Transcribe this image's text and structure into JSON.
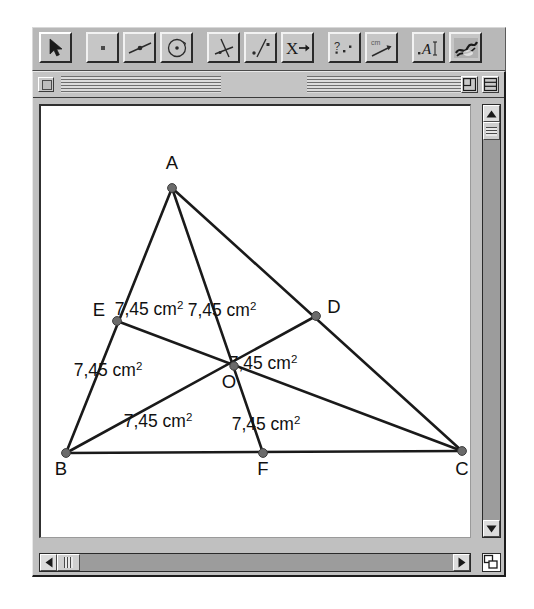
{
  "app": {
    "name": "Cabri Geometry",
    "background_color": "#ffffff",
    "window_chrome_color": "#c0c0c0"
  },
  "toolbar": {
    "groups": [
      {
        "name": "selection",
        "tools": [
          {
            "id": "pointer",
            "icon": "arrow-pointer-icon",
            "label": "Pointer",
            "selected": true
          }
        ]
      },
      {
        "name": "construction",
        "tools": [
          {
            "id": "point",
            "icon": "point-icon",
            "label": "Point",
            "selected": false
          },
          {
            "id": "line",
            "icon": "line-through-point-icon",
            "label": "Line",
            "selected": false
          },
          {
            "id": "circle",
            "icon": "circle-icon",
            "label": "Circle",
            "selected": false
          }
        ]
      },
      {
        "name": "transform",
        "tools": [
          {
            "id": "perpendicular",
            "icon": "perpendicular-line-icon",
            "label": "Perpendicular Line",
            "selected": false
          },
          {
            "id": "reflect",
            "icon": "reflect-point-line-icon",
            "label": "Reflection",
            "selected": false
          },
          {
            "id": "macro",
            "icon": "x-arrow-icon",
            "label": "Macro",
            "selected": false
          }
        ]
      },
      {
        "name": "measure",
        "tools": [
          {
            "id": "check-property",
            "icon": "question-dots-icon",
            "label": "Check Property",
            "selected": false
          },
          {
            "id": "measure",
            "icon": "ruler-cm-icon",
            "label": "Measure",
            "selected": false
          }
        ]
      },
      {
        "name": "display",
        "tools": [
          {
            "id": "label",
            "icon": "text-label-icon",
            "label": "Label",
            "selected": false
          },
          {
            "id": "appearance",
            "icon": "paint-scribble-icon",
            "label": "Appearance",
            "selected": false
          }
        ]
      }
    ]
  },
  "window": {
    "title": "",
    "close_box": "close-box",
    "zoom_box": "zoom-box",
    "collapse_box": "collapse-box",
    "grow_box": "grow-box"
  },
  "scrollbars": {
    "vertical": {
      "up_arrow": "▲",
      "down_arrow": "▼",
      "thumb_position_pct": 4
    },
    "horizontal": {
      "left_arrow": "◀",
      "right_arrow": "▶",
      "thumb_position_pct": 3
    }
  },
  "figure": {
    "type": "euclidean-geometry-construction",
    "canvas": {
      "width": 432,
      "height": 434,
      "origin_x": 38,
      "origin_y": 103
    },
    "points": [
      {
        "id": "A",
        "label": "A",
        "x": 169,
        "y": 185,
        "label_x": 169,
        "label_y": 166
      },
      {
        "id": "B",
        "label": "B",
        "x": 63,
        "y": 450,
        "label_x": 58,
        "label_y": 472
      },
      {
        "id": "C",
        "label": "C",
        "x": 459,
        "y": 448,
        "label_x": 459,
        "label_y": 472
      },
      {
        "id": "D",
        "label": "D",
        "x": 313,
        "y": 313,
        "label_x": 331,
        "label_y": 310
      },
      {
        "id": "E",
        "label": "E",
        "x": 114,
        "y": 318,
        "label_x": 96,
        "label_y": 313
      },
      {
        "id": "F",
        "label": "F",
        "x": 260,
        "y": 450,
        "label_x": 260,
        "label_y": 472
      },
      {
        "id": "O",
        "label": "O",
        "x": 231,
        "y": 363,
        "label_x": 226,
        "label_y": 385
      }
    ],
    "segments": [
      {
        "from": "A",
        "to": "B"
      },
      {
        "from": "A",
        "to": "C"
      },
      {
        "from": "B",
        "to": "C"
      },
      {
        "from": "A",
        "to": "F"
      },
      {
        "from": "B",
        "to": "D"
      },
      {
        "from": "C",
        "to": "E"
      }
    ],
    "area_labels": [
      {
        "id": "area-AEO",
        "text": "7,45 cm",
        "exponent": "2",
        "x": 146,
        "y": 312
      },
      {
        "id": "area-AOD",
        "text": "7,45 cm",
        "exponent": "2",
        "x": 219,
        "y": 313
      },
      {
        "id": "area-BEO",
        "text": "7,45 cm",
        "exponent": "2",
        "x": 105,
        "y": 373
      },
      {
        "id": "area-ODC",
        "text": "7,45 cm",
        "exponent": "2",
        "x": 260,
        "y": 366
      },
      {
        "id": "area-BOF",
        "text": "7,45 cm",
        "exponent": "2",
        "x": 155,
        "y": 424
      },
      {
        "id": "area-OFC",
        "text": "7,45 cm",
        "exponent": "2",
        "x": 263,
        "y": 427
      }
    ],
    "style": {
      "stroke_color": "#1a1a1a",
      "point_color": "#6b6b6b",
      "text_color": "#111111",
      "background": "#ffffff"
    }
  }
}
